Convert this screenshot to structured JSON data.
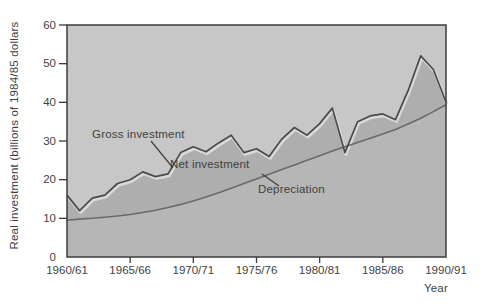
{
  "chart_data": {
    "type": "area",
    "title": "",
    "xlabel": "Year",
    "ylabel": "Real investment (billions of 1984/85 dollars",
    "ylim": [
      0,
      60
    ],
    "y_ticks": [
      0,
      10,
      20,
      30,
      40,
      50,
      60
    ],
    "x_tick_labels": [
      "1960/61",
      "1965/66",
      "1970/71",
      "1975/76",
      "1980/81",
      "1985/86",
      "1990/91"
    ],
    "grid": "off",
    "legend_position": "in-plot text labels with leader lines",
    "categories": [
      "1960/61",
      "1961/62",
      "1962/63",
      "1963/64",
      "1964/65",
      "1965/66",
      "1966/67",
      "1967/68",
      "1968/69",
      "1969/70",
      "1970/71",
      "1971/72",
      "1972/73",
      "1973/74",
      "1974/75",
      "1975/76",
      "1976/77",
      "1977/78",
      "1978/79",
      "1979/80",
      "1980/81",
      "1981/82",
      "1982/83",
      "1983/84",
      "1984/85",
      "1985/86",
      "1986/87",
      "1987/88",
      "1988/89",
      "1989/90",
      "1990/91"
    ],
    "series": [
      {
        "name": "Gross investment",
        "values": [
          16,
          12,
          15.2,
          16,
          19,
          20,
          22,
          20.8,
          21.5,
          27,
          28.5,
          27.2,
          29.5,
          31.5,
          27,
          28,
          26,
          30.5,
          33.5,
          31.5,
          34.5,
          38.5,
          27,
          35,
          36.5,
          37,
          35.5,
          43,
          52,
          48.5,
          40
        ]
      },
      {
        "name": "Depreciation",
        "values": [
          9.5,
          9.8,
          10,
          10.3,
          10.6,
          11,
          11.5,
          12.1,
          12.8,
          13.6,
          14.5,
          15.5,
          16.6,
          17.8,
          19,
          20.2,
          21.4,
          22.6,
          23.8,
          25,
          26.2,
          27.4,
          28.5,
          29.6,
          30.7,
          31.8,
          33,
          34.4,
          35.9,
          37.6,
          39.4
        ]
      }
    ],
    "annotations": [
      {
        "label": "Gross investment",
        "points_to": "top zig-zag line"
      },
      {
        "label": "Net investment",
        "points_to": "shaded band between gross investment and depreciation"
      },
      {
        "label": "Depreciation",
        "points_to": "smooth rising line"
      }
    ]
  },
  "colors": {
    "page_background": "#ffffff",
    "plot_background": "#c7c7c7",
    "net_investment_band": "#aeaeae",
    "depreciation_area": "#b6b6b6",
    "gross_line": "#4a4a4a",
    "gross_line_highlight": "#d9d9d9",
    "depreciation_line": "#6a6a6a",
    "axis": "#3c3c3c",
    "text": "#3f3f3f"
  }
}
